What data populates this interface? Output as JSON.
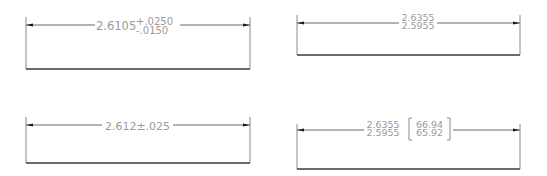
{
  "panels": {
    "deviation": {
      "label": "Deviation tolerance",
      "nominal": "2.6105",
      "upper": "+.0250",
      "lower": "-.0150"
    },
    "limits": {
      "label": "Limit dimensioning",
      "upper": "2.6355",
      "lower": "2.5955"
    },
    "symmetrical": {
      "label": "Symmetrical tolerance",
      "text": "2.612±.025"
    },
    "alternate_units": {
      "label": "Limits with alternate units",
      "upper": "2.6355",
      "lower": "2.5955",
      "alt_upper": "66.94",
      "alt_lower": "65.92"
    }
  },
  "colors": {
    "text": "#9a9a9a",
    "dimension_line": "#6a6a6a",
    "baseline": "#3a3a3a",
    "arrowhead": "#1a1a1a"
  }
}
